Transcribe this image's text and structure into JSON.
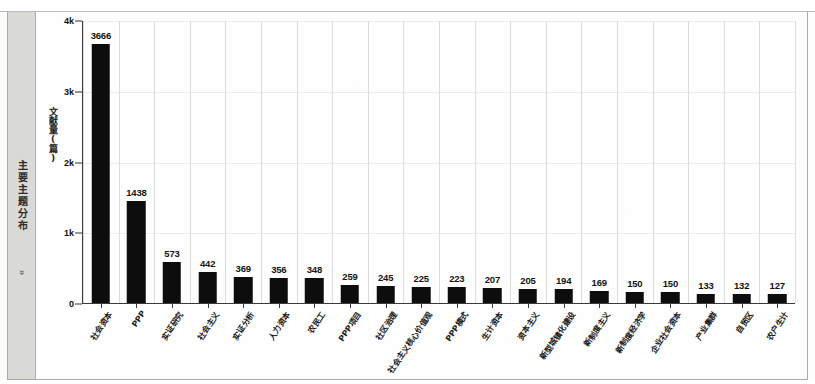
{
  "sidebar": {
    "label": "主要主题分布",
    "chevron": "»"
  },
  "chart_data": {
    "type": "bar",
    "title": "",
    "xlabel": "",
    "ylabel": "文献量(篇)",
    "ylim": [
      0,
      4000
    ],
    "ytick_labels": [
      "0",
      "1k",
      "2k",
      "3k",
      "4k"
    ],
    "ytick_values": [
      0,
      1000,
      2000,
      3000,
      4000
    ],
    "grid": "vertical",
    "legend": "none",
    "bar_color": "#0d0d0d",
    "categories": [
      "社会资本",
      "PPP",
      "实证研究",
      "社会主义",
      "实证分析",
      "人力资本",
      "农民工",
      "PPP项目",
      "社区治理",
      "社会主义核心价值观",
      "PPP模式",
      "生计资本",
      "资本主义",
      "新型城镇化建设",
      "新制度主义",
      "新制度经济学",
      "企业社会资本",
      "产业集群",
      "自贸区",
      "农户生计"
    ],
    "values": [
      3666,
      1438,
      573,
      442,
      369,
      356,
      348,
      259,
      245,
      225,
      223,
      207,
      205,
      194,
      169,
      150,
      150,
      133,
      132,
      127
    ],
    "value_labels": [
      "3666",
      "1438",
      "573",
      "442",
      "369",
      "356",
      "348",
      "259",
      "245",
      "225",
      "223",
      "207",
      "205",
      "194",
      "169",
      "150",
      "150",
      "133",
      "132",
      "127"
    ]
  }
}
